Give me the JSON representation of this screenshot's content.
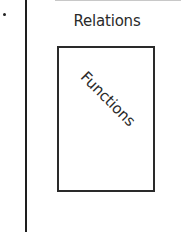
{
  "diagram": {
    "outer_set": {
      "label": "Relations"
    },
    "inner_set": {
      "label": "Functions",
      "rotation_deg": 45
    },
    "colors": {
      "stroke": "#2a2a2a",
      "background": "#ffffff"
    }
  }
}
